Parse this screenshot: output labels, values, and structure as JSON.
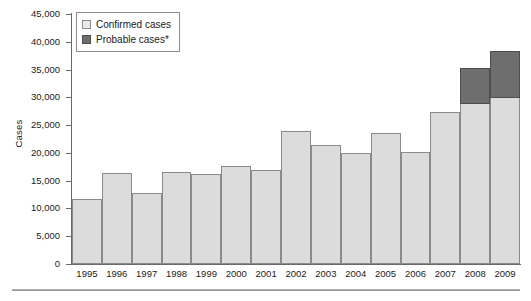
{
  "chart_data": {
    "type": "bar",
    "subtype": "stacked-bar",
    "title": "",
    "subtitle": "",
    "xlabel": "",
    "ylabel": "Cases",
    "categories": [
      "1995",
      "1996",
      "1997",
      "1998",
      "1999",
      "2000",
      "2001",
      "2002",
      "2003",
      "2004",
      "2005",
      "2006",
      "2007",
      "2008",
      "2009"
    ],
    "series": [
      {
        "name": "Confirmed cases",
        "color": "#dcdcdc",
        "values": [
          11700,
          16300,
          12800,
          16600,
          16200,
          17700,
          17000,
          24000,
          21400,
          20000,
          23600,
          20200,
          27400,
          29000,
          30000
        ]
      },
      {
        "name": "Probable cases*",
        "color": "#6e6e6e",
        "values": [
          0,
          0,
          0,
          0,
          0,
          0,
          0,
          0,
          0,
          0,
          0,
          0,
          0,
          6500,
          8600
        ]
      }
    ],
    "totals": [
      11700,
      16300,
      12800,
      16600,
      16200,
      17700,
      17000,
      24000,
      21400,
      20000,
      23600,
      20200,
      27400,
      35500,
      38600
    ],
    "ylim": [
      0,
      45000
    ],
    "ytick_step": 5000,
    "yticks": [
      0,
      5000,
      10000,
      15000,
      20000,
      25000,
      30000,
      35000,
      40000,
      45000
    ],
    "ytick_labels": [
      "0",
      "5,000",
      "10,000",
      "15,000",
      "20,000",
      "25,000",
      "30,000",
      "35,000",
      "40,000",
      "45,000"
    ],
    "grid": false,
    "legend_position": "top-left"
  },
  "legend": {
    "items": [
      {
        "label": "Confirmed cases",
        "swatch": "light-gray-square",
        "color": "#e9e9e9"
      },
      {
        "label": "Probable cases*",
        "swatch": "dark-gray-square",
        "color": "#6e6e6e"
      }
    ]
  },
  "axes": {
    "y_title": "Cases"
  }
}
